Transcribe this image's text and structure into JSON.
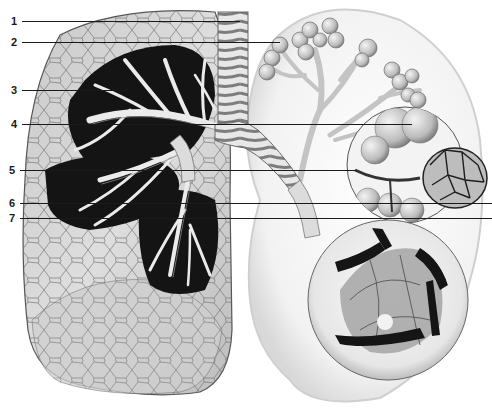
{
  "figure": {
    "type": "anatomical-illustration",
    "colors": {
      "background": "#ffffff",
      "lung_tissue": "#d9d9d9",
      "lung_lobule_lines": "#5a5a5a",
      "cavity_dark": "#111111",
      "bronchi": "#eeeeee",
      "bronchi_shade": "#9a9a9a",
      "inset_bg": "#ececec",
      "leader_line": "#1a1a1a"
    }
  },
  "labels": [
    {
      "num": "1",
      "y": 21,
      "x_end": 240
    },
    {
      "num": "2",
      "y": 42,
      "x_end": 280
    },
    {
      "num": "3",
      "y": 90,
      "x_end": 130
    },
    {
      "num": "4",
      "y": 124,
      "x_end": 412
    },
    {
      "num": "5",
      "y": 170,
      "x_end": 356
    },
    {
      "num": "6",
      "y": 203,
      "x_end": 492
    },
    {
      "num": "7",
      "y": 218,
      "x_end": 492
    }
  ]
}
